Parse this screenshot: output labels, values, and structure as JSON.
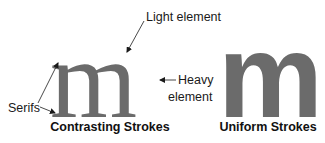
{
  "figure": {
    "left": {
      "glyph": "m",
      "caption": "Contrasting Strokes",
      "labels": {
        "light": "Light element",
        "heavy_line1": "Heavy",
        "heavy_line2": "element",
        "serifs": "Serifs"
      }
    },
    "right": {
      "glyph": "m",
      "caption": "Uniform Strokes"
    }
  },
  "colors": {
    "glyph": "#6b6b6b",
    "text": "#1a1a1a"
  }
}
